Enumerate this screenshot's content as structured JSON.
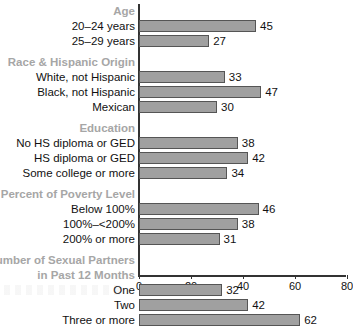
{
  "chart_data": {
    "type": "bar",
    "orientation": "horizontal",
    "title": "",
    "xlabel": "",
    "ylabel": "",
    "xlim": [
      0,
      80
    ],
    "xticks": [
      0,
      20,
      40,
      60,
      80
    ],
    "xtick_labels": [
      "0",
      "20",
      "40",
      "60",
      "80"
    ],
    "grid": false,
    "legend": null,
    "bar_color": "#a0a0a0",
    "bar_border_color": "#555555",
    "group_header_color": "#a6a6a6",
    "label_color": "#111111",
    "groups": [
      {
        "header": "Age",
        "header_lines": [
          "Age"
        ],
        "categories": [
          "20–24 years",
          "25–29 years"
        ],
        "values": [
          45,
          27
        ]
      },
      {
        "header": "Race & Hispanic Origin",
        "header_lines": [
          "Race & Hispanic Origin"
        ],
        "categories": [
          "White, not Hispanic",
          "Black, not Hispanic",
          "Mexican"
        ],
        "values": [
          33,
          47,
          30
        ]
      },
      {
        "header": "Education",
        "header_lines": [
          "Education"
        ],
        "categories": [
          "No HS diploma or GED",
          "HS diploma or GED",
          "Some college or more"
        ],
        "values": [
          38,
          42,
          34
        ]
      },
      {
        "header": "Percent of Poverty Level",
        "header_lines": [
          "Percent of Poverty Level"
        ],
        "categories": [
          "Below 100%",
          "100%–<200%",
          "200% or more"
        ],
        "values": [
          46,
          38,
          31
        ]
      },
      {
        "header": "Number of Sexual Partners in Past 12 Months",
        "header_lines": [
          "Number of Sexual Partners",
          "in Past 12 Months"
        ],
        "categories": [
          "One",
          "Two",
          "Three or more"
        ],
        "values": [
          32,
          42,
          62
        ]
      }
    ],
    "categories": [
      "20–24 years",
      "25–29 years",
      "White, not Hispanic",
      "Black, not Hispanic",
      "Mexican",
      "No HS diploma or GED",
      "HS diploma or GED",
      "Some college or more",
      "Below 100%",
      "100%–<200%",
      "200% or more",
      "One",
      "Two",
      "Three or more"
    ],
    "values": [
      45,
      27,
      33,
      47,
      30,
      38,
      42,
      34,
      46,
      38,
      31,
      32,
      42,
      62
    ]
  }
}
